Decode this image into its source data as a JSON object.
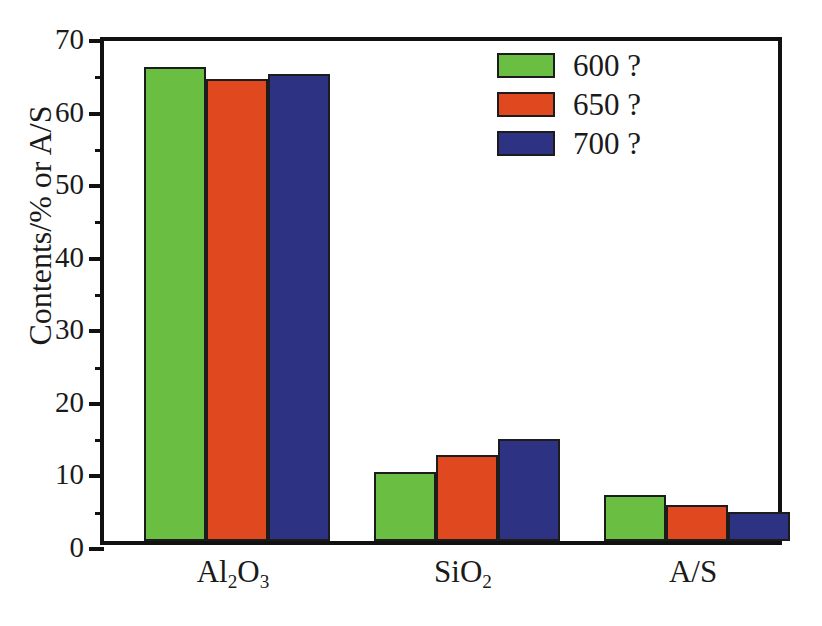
{
  "chart_data": {
    "type": "bar",
    "title": "",
    "xlabel": "",
    "ylabel": "Contents/% or A/S",
    "categories": [
      "Al2O3",
      "SiO2",
      "A/S"
    ],
    "category_labels_html": [
      "Al<sub>2</sub>O<sub>3</sub>",
      "SiO<sub>2</sub>",
      "A/S"
    ],
    "ylim": [
      0,
      70
    ],
    "ytick_values": [
      0,
      10,
      20,
      30,
      40,
      50,
      60,
      70
    ],
    "ytick_labels": [
      "0",
      "10",
      "20",
      "30",
      "40",
      "50",
      "60",
      "70"
    ],
    "yminor_values": [
      5,
      15,
      25,
      35,
      45,
      55,
      65
    ],
    "grid": false,
    "legend_position": "upper right",
    "series": [
      {
        "name": "600 ?",
        "color": "#6ABF42",
        "values": [
          65.3,
          9.5,
          6.4
        ]
      },
      {
        "name": "650 ?",
        "color": "#E0481F",
        "values": [
          63.6,
          11.8,
          5.0
        ]
      },
      {
        "name": "700 ?",
        "color": "#2E3282",
        "values": [
          64.4,
          14.0,
          4.0
        ]
      }
    ]
  },
  "axes": {
    "y_title": "Contents/% or A/S",
    "frame_color": "#111111"
  },
  "legend": {
    "entries": [
      {
        "label": "600 ?",
        "color": "#6ABF42"
      },
      {
        "label": "650 ?",
        "color": "#E0481F"
      },
      {
        "label": "700 ?",
        "color": "#2E3282"
      }
    ]
  },
  "geometry": {
    "plot_left": 100,
    "plot_top": 37,
    "plot_width": 682,
    "plot_height": 508,
    "bar_width": 62,
    "group_starts": [
      40,
      270,
      500
    ],
    "group_label_centers": [
      233,
      463,
      693
    ]
  }
}
